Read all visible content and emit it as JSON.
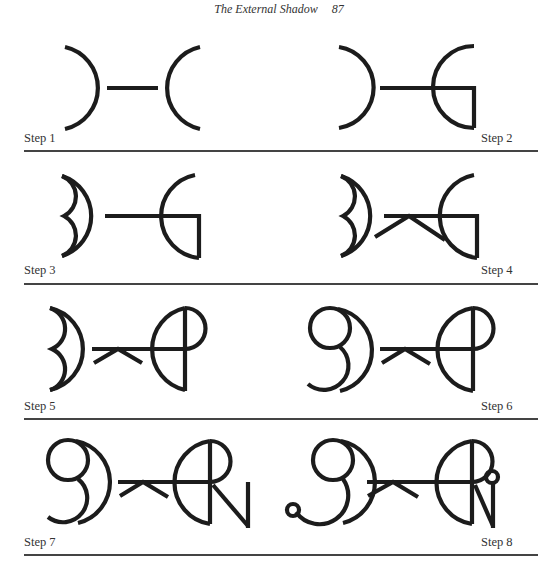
{
  "header": {
    "running_title": "The External Shadow",
    "page_number": "87"
  },
  "steps": [
    {
      "label": "Step 1"
    },
    {
      "label": "Step 2"
    },
    {
      "label": "Step 3"
    },
    {
      "label": "Step 4"
    },
    {
      "label": "Step 5"
    },
    {
      "label": "Step 6"
    },
    {
      "label": "Step 7"
    },
    {
      "label": "Step 8"
    }
  ],
  "colors": {
    "ink": "#1c1c1c",
    "rule": "#444444",
    "background": "#ffffff"
  }
}
